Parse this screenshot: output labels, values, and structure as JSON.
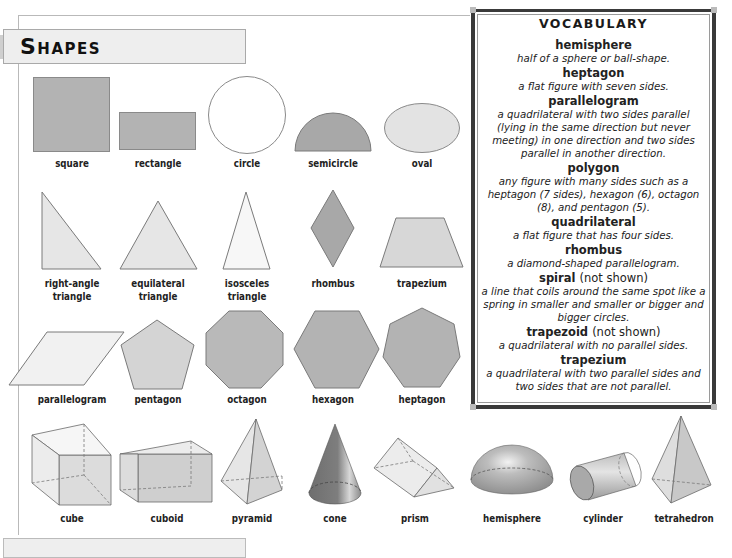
{
  "page": {
    "title": "Shapes"
  },
  "shapes": {
    "row1": [
      {
        "name": "square",
        "label": "square"
      },
      {
        "name": "rectangle",
        "label": "rectangle"
      },
      {
        "name": "circle",
        "label": "circle"
      },
      {
        "name": "semicircle",
        "label": "semicircle"
      },
      {
        "name": "oval",
        "label": "oval"
      }
    ],
    "row2": [
      {
        "name": "right-angle-triangle",
        "label_line1": "right-angle",
        "label_line2": "triangle"
      },
      {
        "name": "equilateral-triangle",
        "label_line1": "equilateral",
        "label_line2": "triangle"
      },
      {
        "name": "isosceles-triangle",
        "label_line1": "isosceles",
        "label_line2": "triangle"
      },
      {
        "name": "rhombus",
        "label": "rhombus"
      },
      {
        "name": "trapezium",
        "label": "trapezium"
      }
    ],
    "row3": [
      {
        "name": "parallelogram",
        "label": "parallelogram"
      },
      {
        "name": "pentagon",
        "label": "pentagon"
      },
      {
        "name": "octagon",
        "label": "octagon"
      },
      {
        "name": "hexagon",
        "label": "hexagon"
      },
      {
        "name": "heptagon",
        "label": "heptagon"
      }
    ],
    "row4": [
      {
        "name": "cube",
        "label": "cube"
      },
      {
        "name": "cuboid",
        "label": "cuboid"
      },
      {
        "name": "pyramid",
        "label": "pyramid"
      },
      {
        "name": "cone",
        "label": "cone"
      },
      {
        "name": "prism",
        "label": "prism"
      },
      {
        "name": "hemisphere",
        "label": "hemisphere"
      },
      {
        "name": "cylinder",
        "label": "cylinder"
      },
      {
        "name": "tetrahedron",
        "label": "tetrahedron"
      }
    ]
  },
  "colors": {
    "dark_fill": "#a9a9a9",
    "mid_fill": "#c4c4c4",
    "light_fill": "#e6e6e6",
    "stroke": "#7a7a7a"
  },
  "vocabulary": {
    "title": "VOCABULARY",
    "entries": [
      {
        "term": "hemisphere",
        "note": "",
        "definition": "half of a sphere or ball-shape."
      },
      {
        "term": "heptagon",
        "note": "",
        "definition": "a flat figure with seven sides."
      },
      {
        "term": "parallelogram",
        "note": "",
        "definition": "a quadrilateral with two sides parallel (lying in the same direction but never meeting) in one direction and two sides parallel in another direction."
      },
      {
        "term": "polygon",
        "note": "",
        "definition": "any figure with many sides such as a heptagon (7 sides), hexagon (6), octagon (8), and pentagon (5)."
      },
      {
        "term": "quadrilateral",
        "note": "",
        "definition": "a flat figure that has four sides."
      },
      {
        "term": "rhombus",
        "note": "",
        "definition": "a diamond-shaped parallelogram."
      },
      {
        "term": "spiral",
        "note": "(not shown)",
        "definition": "a line that coils around the same spot like a spring in smaller and smaller or bigger and bigger circles."
      },
      {
        "term": "trapezoid",
        "note": "(not shown)",
        "definition": "a quadrilateral with no parallel sides."
      },
      {
        "term": "trapezium",
        "note": "",
        "definition": "a quadrilateral with two parallel sides and two sides that are not parallel."
      }
    ]
  }
}
